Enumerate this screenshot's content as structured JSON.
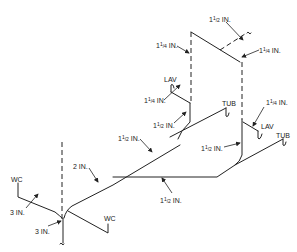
{
  "diagram": {
    "type": "isometric plumbing drainage/vent riser diagram",
    "fixtures": {
      "lav_upper": "LAV",
      "tub_upper": "TUB",
      "lav_right": "LAV",
      "tub_right": "TUB",
      "wc_left": "WC",
      "wc_bottom": "WC"
    },
    "pipe_sizes": {
      "vent_top": "1 1/2 IN.",
      "vent_left": "1 1/4 IN.",
      "vent_right": "1 1/4 IN.",
      "lav_upper_branch": "1 1/4 IN.",
      "lav_upper_drain": "1 1/2 IN.",
      "lav_right_branch": "1 1/4 IN.",
      "upper_branch": "1 1/2 IN.",
      "right_riser": "1 1/2 IN.",
      "lower_branch": "1 1/2 IN.",
      "main_2in": "2 IN.",
      "wc_left_branch": "3 IN.",
      "stack_base": "3 IN."
    },
    "label_parts": {
      "whole_1": "1",
      "half_num": "1",
      "half_den": "2",
      "quarter_num": "1",
      "quarter_den": "4",
      "slash": "/",
      "unit": " IN.",
      "two_in": "2 IN.",
      "three_in": "3 IN."
    }
  }
}
